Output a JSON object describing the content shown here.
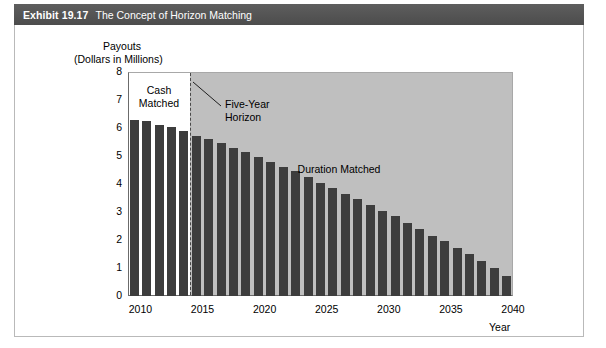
{
  "header": {
    "exhibit_number": "Exhibit 19.17",
    "title": "The Concept of Horizon Matching"
  },
  "colors": {
    "header_bar": "#575757",
    "bar_fill": "#3d3d3d",
    "shaded_region": "#bfbfbf",
    "plot_border": "#6b6b6b",
    "horizon_line": "#4a4a4a",
    "frame_border": "#b9b9b9",
    "text": "#000000",
    "header_text": "#ffffff"
  },
  "chart_data": {
    "type": "bar",
    "title": "The Concept of Horizon Matching",
    "xlabel": "Year",
    "ylabel": "Payouts",
    "ylabel_units": "(Dollars in Millions)",
    "ylim": [
      0,
      8
    ],
    "ytick_labels": [
      "8",
      "7",
      "6",
      "5",
      "4",
      "3",
      "2",
      "1",
      "0"
    ],
    "yticks": [
      8,
      7,
      6,
      5,
      4,
      3,
      2,
      1,
      0
    ],
    "xlim": [
      2009.5,
      2040.5
    ],
    "xtick_labels": [
      "2010",
      "2015",
      "2020",
      "2025",
      "2030",
      "2035",
      "2040"
    ],
    "xticks": [
      2010,
      2015,
      2020,
      2025,
      2030,
      2035,
      2040
    ],
    "grid": false,
    "legend": "none",
    "categories": [
      "2010",
      "2011",
      "2012",
      "2013",
      "2014",
      "2015",
      "2016",
      "2017",
      "2018",
      "2019",
      "2020",
      "2021",
      "2022",
      "2023",
      "2024",
      "2025",
      "2026",
      "2027",
      "2028",
      "2029",
      "2030",
      "2031",
      "2032",
      "2033",
      "2034",
      "2035",
      "2036",
      "2037",
      "2038",
      "2039",
      "2040"
    ],
    "values": [
      6.3,
      6.25,
      6.1,
      6.05,
      5.9,
      5.7,
      5.6,
      5.45,
      5.3,
      5.15,
      4.95,
      4.8,
      4.6,
      4.45,
      4.25,
      4.05,
      3.85,
      3.65,
      3.45,
      3.25,
      3.05,
      2.85,
      2.6,
      2.4,
      2.15,
      1.95,
      1.7,
      1.5,
      1.25,
      1.0,
      0.7
    ],
    "annotations": [
      {
        "name": "cash-matched",
        "text": "Cash\nMatched",
        "x_year": 2012.0,
        "y_value": 7.35
      },
      {
        "name": "five-year-horizon",
        "text": "Five-Year\nHorizon",
        "x_year": 2017.3,
        "y_value": 6.85
      },
      {
        "name": "duration-matched",
        "text": "Duration Matched",
        "x_year": 2026.5,
        "y_value": 4.55
      }
    ],
    "regions": [
      {
        "name": "duration-matched-shading",
        "x_start_year": 2014.5,
        "x_end_year": 2040.5,
        "fill": "#bfbfbf"
      }
    ],
    "vlines": [
      {
        "name": "five-year-horizon-line",
        "x_year": 2014.5,
        "style": "dashed",
        "color": "#4a4a4a"
      }
    ]
  }
}
